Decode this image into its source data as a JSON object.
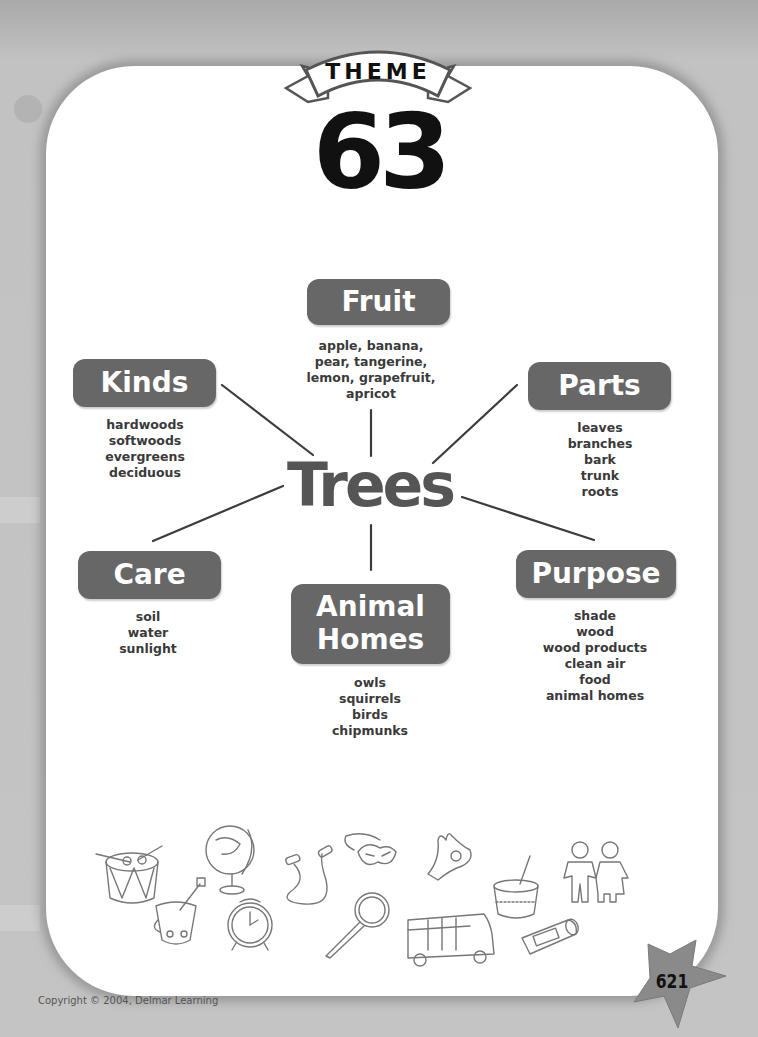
{
  "header": {
    "banner_label": "THEME",
    "theme_number": "63"
  },
  "web": {
    "center": "Trees",
    "branches": [
      {
        "id": "fruit",
        "label": "Fruit",
        "items": [
          "apple, banana,",
          "pear, tangerine,",
          "lemon, grapefruit,",
          "apricot"
        ]
      },
      {
        "id": "kinds",
        "label": "Kinds",
        "items": [
          "hardwoods",
          "softwoods",
          "evergreens",
          "deciduous"
        ]
      },
      {
        "id": "parts",
        "label": "Parts",
        "items": [
          "leaves",
          "branches",
          "bark",
          "trunk",
          "roots"
        ]
      },
      {
        "id": "care",
        "label": "Care",
        "items": [
          "soil",
          "water",
          "sunlight"
        ]
      },
      {
        "id": "animal-homes",
        "label_lines": [
          "Animal",
          "Homes"
        ],
        "items": [
          "owls",
          "squirrels",
          "birds",
          "chipmunks"
        ]
      },
      {
        "id": "purpose",
        "label": "Purpose",
        "items": [
          "shade",
          "wood",
          "wood products",
          "clean air",
          "food",
          "animal homes"
        ]
      }
    ]
  },
  "illustrations": [
    "drum-icon",
    "sand-bucket-icon",
    "globe-icon",
    "alarm-clock-icon",
    "jump-rope-icon",
    "magnifying-glass-icon",
    "mask-icon",
    "ok-hand-icon",
    "school-bus-icon",
    "pudding-cup-icon",
    "glue-stick-icon",
    "paper-dolls-icon"
  ],
  "footer": {
    "copyright": "Copyright © 2004, Delmar Learning",
    "page_number": "621"
  },
  "colors": {
    "pill": "#676767",
    "center_text": "#555555",
    "background": "#c4c4c4",
    "card": "#ffffff"
  }
}
